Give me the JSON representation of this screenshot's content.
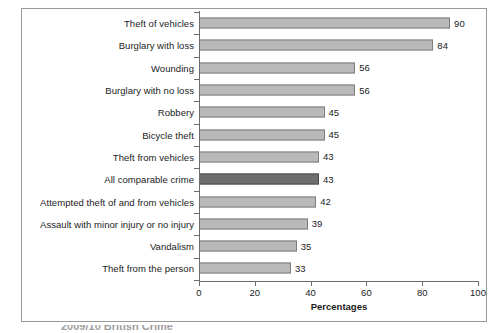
{
  "chart_data": {
    "type": "bar",
    "orientation": "horizontal",
    "title": "",
    "subtitle": "",
    "xlabel": "Percentages",
    "ylabel": "",
    "xlim": [
      0,
      100
    ],
    "xticks": [
      0,
      20,
      40,
      60,
      80,
      100
    ],
    "grid": false,
    "legend": null,
    "categories": [
      "Theft of vehicles",
      "Burglary with loss",
      "Wounding",
      "Burglary with no loss",
      "Robbery",
      "Bicycle theft",
      "Theft from vehicles",
      "All comparable crime",
      "Attempted theft of and from vehicles",
      "Assault with minor injury or no injury",
      "Vandalism",
      "Theft from the person"
    ],
    "values": [
      90,
      84,
      56,
      56,
      45,
      45,
      43,
      43,
      42,
      39,
      35,
      33
    ],
    "value_labels": [
      "90",
      "84",
      "56",
      "56",
      "45",
      "45",
      "43",
      "43",
      "42",
      "39",
      "35",
      "33"
    ],
    "highlighted_categories": [
      "All comparable crime"
    ],
    "colors": {
      "bar_fill": "#b9b9b9",
      "bar_border": "#7d7d7d",
      "bar_fill_highlight": "#6e6e6e",
      "bar_border_highlight": "#4a4a4a",
      "axis": "#6d6d6d",
      "text": "#1b1b1b",
      "frame": "#9a9a9a",
      "background": "#ffffff"
    }
  },
  "caption": {
    "clipped_text": "2009/10 British Crime"
  }
}
